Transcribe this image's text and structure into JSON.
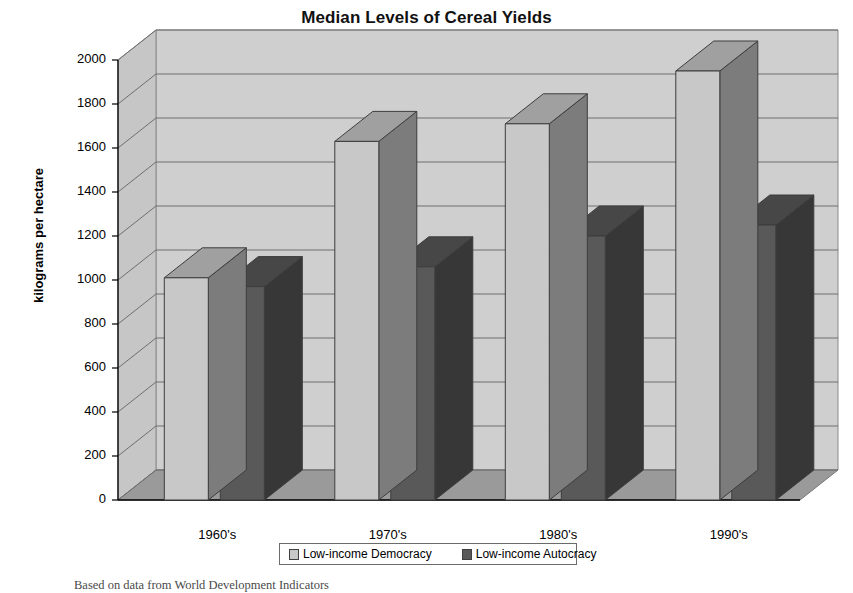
{
  "chart": {
    "title": "Median Levels of Cereal Yields",
    "ylabel": "kilograms per hectare",
    "caption": "Based on data from World Development Indicators"
  },
  "legend": {
    "items": [
      {
        "label": "Low-income Democracy",
        "color": "#c8c8c8"
      },
      {
        "label": "Low-income Autocracy",
        "color": "#595959"
      }
    ]
  },
  "chart_data": {
    "type": "bar",
    "title": "Median Levels of Cereal Yields",
    "xlabel": "",
    "ylabel": "kilograms per hectare",
    "ylim": [
      0,
      2000
    ],
    "yticks": [
      0,
      200,
      400,
      600,
      800,
      1000,
      1200,
      1400,
      1600,
      1800,
      2000
    ],
    "ytick_labels": [
      "0",
      "200",
      "400",
      "600",
      "800",
      "1000",
      "1200",
      "1400",
      "1600",
      "1800",
      "2000"
    ],
    "categories": [
      "1960's",
      "1970's",
      "1980's",
      "1990's"
    ],
    "grid": true,
    "legend_position": "bottom",
    "three_d": true,
    "series": [
      {
        "name": "Low-income Democracy",
        "color": "#c8c8c8",
        "values": [
          1010,
          1630,
          1710,
          1950
        ]
      },
      {
        "name": "Low-income Autocracy",
        "color": "#595959",
        "values": [
          970,
          1060,
          1200,
          1250
        ]
      }
    ]
  }
}
